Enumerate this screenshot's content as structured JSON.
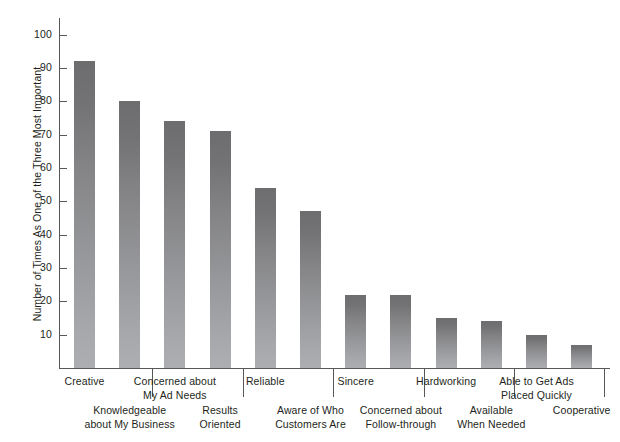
{
  "chart_data": {
    "type": "bar",
    "title": "",
    "xlabel": "",
    "ylabel": "Number of Times As One of the Three Most Important",
    "ylim": [
      0,
      105
    ],
    "yticks": [
      10,
      20,
      30,
      40,
      50,
      60,
      70,
      80,
      90,
      100
    ],
    "grid": false,
    "legend": false,
    "bar_color_top": "#6d6d6f",
    "bar_color_bottom": "#adaeb1",
    "axis_color": "#58585a",
    "categories": [
      "Creative",
      "Knowledgeable\nabout My Business",
      "Concerned about\nMy Ad Needs",
      "Results\nOriented",
      "Reliable",
      "Aware of Who\nCustomers Are",
      "Sincere",
      "Concerned about\nFollow-through",
      "Hardworking",
      "Available\nWhen Needed",
      "Able to Get Ads\nPlaced Quickly",
      "Cooperative"
    ],
    "values": [
      92,
      80,
      74,
      71,
      54,
      47,
      22,
      22,
      15,
      14,
      10,
      7
    ]
  }
}
